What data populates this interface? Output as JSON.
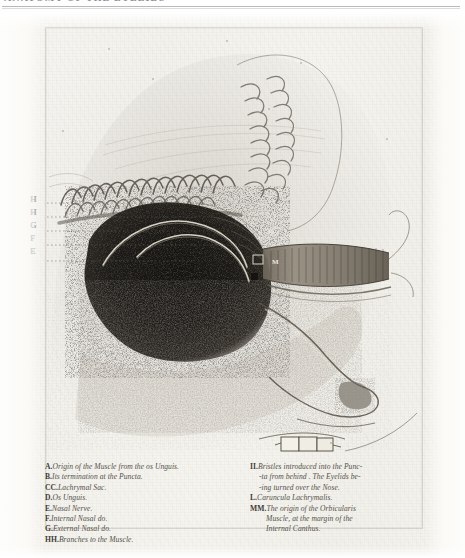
{
  "header": {
    "running_title": "ANATOMY OF THE EYELIDS",
    "note": "cropped at top edge of page"
  },
  "plate": {
    "description": "Engraved anatomical plate: human head in left profile with dissection of the orbicularis muscle, lachrymal apparatus and nasal nerves.",
    "paper_color": "#f4f3ee",
    "ink_color": "#4a4741",
    "dark_mass_color": "#1e1c19"
  },
  "figure_labels": [
    {
      "id": "lbl-h1",
      "text": "H"
    },
    {
      "id": "lbl-h2",
      "text": "H"
    },
    {
      "id": "lbl-g",
      "text": "G"
    },
    {
      "id": "lbl-f",
      "text": "F"
    },
    {
      "id": "lbl-e",
      "text": "E"
    }
  ],
  "inner_labels": [
    {
      "id": "inner-k",
      "text": "K"
    },
    {
      "id": "inner-m",
      "text": "M"
    }
  ],
  "caption": {
    "left_column": [
      {
        "key": "A.",
        "text": "Origin of the Muscle from the os Unguis.",
        "indent": 0
      },
      {
        "key": "B.",
        "text": "Its termination at the Puncta.",
        "indent": 0
      },
      {
        "key": "CC.",
        "text": "Lachrymal Sac.",
        "indent": 0
      },
      {
        "key": "D.",
        "text": "Os Unguis.",
        "indent": 0
      },
      {
        "key": "E.",
        "text": "Nasal Nerve.",
        "indent": 0
      },
      {
        "key": "F.",
        "text": "Internal Nasal do.",
        "indent": 0
      },
      {
        "key": "G.",
        "text": "External Nasal do.",
        "indent": 0
      },
      {
        "key": "HH.",
        "text": "Branches to the Muscle.",
        "indent": 0
      }
    ],
    "right_column": [
      {
        "key": "II.",
        "text": "Bristles introduced into the Punc-",
        "indent": 0
      },
      {
        "key": "",
        "text": "-ta from behind . The Eyelids be-",
        "indent": 1
      },
      {
        "key": "",
        "text": "-ing turned over the Nose.",
        "indent": 1
      },
      {
        "key": "L.",
        "text": "Caruncula Lachrymalis.",
        "indent": 0
      },
      {
        "key": "MM.",
        "text": "The origin of the Orbicularis",
        "indent": 0
      },
      {
        "key": "",
        "text": "Muscle, at the margin of the",
        "indent": 2
      },
      {
        "key": "",
        "text": "Internal Canthus.",
        "indent": 2
      }
    ]
  }
}
